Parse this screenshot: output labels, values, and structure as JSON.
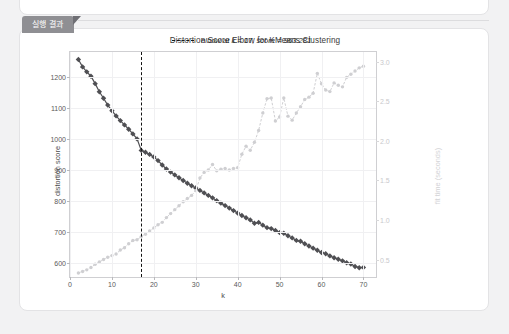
{
  "panel": {
    "tab_label": "실행 결과"
  },
  "chart_data": {
    "type": "line",
    "title": "Distortion Score Elbow for KMeans Clustering",
    "xlabel": "k",
    "ylabel": "distortion score",
    "y2label": "fit time (seconds)",
    "xlim": [
      0,
      73
    ],
    "ylim": [
      555,
      1280
    ],
    "y2lim": [
      0.28,
      3.12
    ],
    "grid": true,
    "legend_position": "top-right",
    "legend": [
      {
        "label": "elbow at k = 17, score = 963.281",
        "style": "dashed",
        "color": "#141414"
      }
    ],
    "annotations": [
      {
        "type": "vline",
        "x": 17,
        "label": "elbow at k = 17, score = 963.281"
      }
    ],
    "xticks": [
      0,
      10,
      20,
      30,
      40,
      50,
      60,
      70
    ],
    "yticks": [
      600,
      700,
      800,
      900,
      1000,
      1100,
      1200
    ],
    "y2ticks": [
      0.5,
      1.0,
      1.5,
      2.0,
      2.5,
      3.0
    ],
    "series": [
      {
        "name": "distortion score",
        "axis": "left",
        "color": "#4f4f53",
        "marker": "diamond",
        "x": [
          2,
          3,
          4,
          5,
          6,
          7,
          8,
          9,
          10,
          11,
          12,
          13,
          14,
          15,
          16,
          17,
          18,
          19,
          20,
          21,
          22,
          23,
          24,
          25,
          26,
          27,
          28,
          29,
          30,
          31,
          32,
          33,
          34,
          35,
          36,
          37,
          38,
          39,
          40,
          41,
          42,
          43,
          44,
          45,
          46,
          47,
          48,
          49,
          50,
          51,
          52,
          53,
          54,
          55,
          56,
          57,
          58,
          59,
          60,
          61,
          62,
          63,
          64,
          65,
          66,
          67,
          68,
          69,
          70
        ],
        "values": [
          1256,
          1232,
          1216,
          1202,
          1178,
          1152,
          1131,
          1109,
          1091,
          1074,
          1059,
          1045,
          1031,
          1016,
          1000,
          963,
          957,
          950,
          942,
          930,
          916,
          903,
          893,
          884,
          875,
          866,
          857,
          849,
          842,
          834,
          826,
          818,
          810,
          801,
          793,
          785,
          777,
          769,
          761,
          753,
          746,
          739,
          728,
          731,
          722,
          714,
          711,
          705,
          698,
          696,
          688,
          681,
          673,
          670,
          662,
          655,
          648,
          641,
          634,
          630,
          623,
          617,
          612,
          607,
          601,
          597,
          589,
          585,
          586
        ]
      },
      {
        "name": "fit time (seconds)",
        "axis": "right",
        "color": "#cfcfd2",
        "marker": "circle",
        "x": [
          2,
          3,
          4,
          5,
          6,
          7,
          8,
          9,
          10,
          11,
          12,
          13,
          14,
          15,
          16,
          17,
          18,
          19,
          20,
          21,
          22,
          23,
          24,
          25,
          26,
          27,
          28,
          29,
          30,
          31,
          32,
          33,
          34,
          35,
          36,
          37,
          38,
          39,
          40,
          41,
          42,
          43,
          44,
          45,
          46,
          47,
          48,
          49,
          50,
          51,
          52,
          53,
          54,
          55,
          56,
          57,
          58,
          59,
          60,
          61,
          62,
          63,
          64,
          65,
          66,
          67,
          68,
          69,
          70
        ],
        "values": [
          0.33,
          0.35,
          0.37,
          0.4,
          0.44,
          0.47,
          0.5,
          0.53,
          0.55,
          0.57,
          0.62,
          0.65,
          0.7,
          0.74,
          0.75,
          0.79,
          0.82,
          0.86,
          0.9,
          0.94,
          0.97,
          1.03,
          1.08,
          1.13,
          1.18,
          1.23,
          1.27,
          1.31,
          1.37,
          1.53,
          1.6,
          1.63,
          1.7,
          1.62,
          1.64,
          1.65,
          1.63,
          1.65,
          1.66,
          1.83,
          1.93,
          1.88,
          1.98,
          2.13,
          2.35,
          2.53,
          2.54,
          2.25,
          2.3,
          2.54,
          2.31,
          2.26,
          2.35,
          2.43,
          2.52,
          2.55,
          2.6,
          2.85,
          2.72,
          2.64,
          2.62,
          2.73,
          2.7,
          2.68,
          2.8,
          2.84,
          2.88,
          2.92,
          2.94
        ]
      }
    ]
  }
}
